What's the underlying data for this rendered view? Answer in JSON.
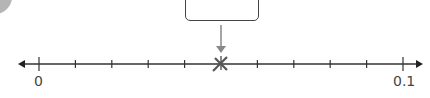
{
  "number_line": {
    "start_label": "0",
    "end_label": "0.1",
    "tick_count": 11,
    "marked_value": "0.05",
    "marker_symbol": "x"
  },
  "answer_box": {
    "value": ""
  },
  "colors": {
    "line": "#333333",
    "arrow": "#888888",
    "marker": "#555555",
    "box_border": "#444444",
    "corner_circle": "#b5b5b5"
  }
}
